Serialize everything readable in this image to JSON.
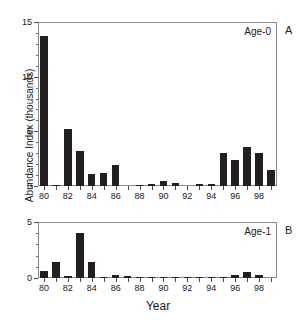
{
  "figure": {
    "xlabel": "Year",
    "ylabel": "Abundance Index (thousands)",
    "bar_color": "#231f20",
    "axis_color": "#8a8a8a"
  },
  "panels": {
    "a": {
      "letter": "A",
      "annotation": "Age-0"
    },
    "b": {
      "letter": "B",
      "annotation": "Age-1"
    }
  },
  "chart_data": [
    {
      "type": "bar",
      "title": "Age-0",
      "panel_letter": "A",
      "xlabel": "Year",
      "ylabel": "Abundance Index (thousands)",
      "ylim": [
        0,
        15
      ],
      "yticks": [
        0,
        5,
        10,
        15
      ],
      "yticklabels": [
        "0",
        "5",
        "10",
        "15"
      ],
      "grid": false,
      "legend": "none",
      "categories": [
        "80",
        "81",
        "82",
        "83",
        "84",
        "85",
        "86",
        "87",
        "88",
        "89",
        "90",
        "91",
        "92",
        "93",
        "94",
        "95",
        "96",
        "97",
        "98",
        "99"
      ],
      "xticklabels": [
        "80",
        "82",
        "84",
        "86",
        "88",
        "90",
        "92",
        "94",
        "96",
        "98"
      ],
      "values": [
        13.7,
        0.1,
        5.2,
        3.2,
        1.1,
        1.2,
        1.9,
        0.0,
        0.1,
        0.2,
        0.5,
        0.3,
        0.0,
        0.15,
        0.15,
        3.0,
        2.4,
        3.6,
        3.0,
        1.5
      ]
    },
    {
      "type": "bar",
      "title": "Age-1",
      "panel_letter": "B",
      "xlabel": "Year",
      "ylabel": "Abundance Index (thousands)",
      "ylim": [
        0,
        5
      ],
      "yticks": [
        0,
        5
      ],
      "yticklabels": [
        "0",
        "5"
      ],
      "grid": false,
      "legend": "none",
      "categories": [
        "80",
        "81",
        "82",
        "83",
        "84",
        "85",
        "86",
        "87",
        "88",
        "89",
        "90",
        "91",
        "92",
        "93",
        "94",
        "95",
        "96",
        "97",
        "98",
        "99"
      ],
      "xticklabels": [
        "80",
        "82",
        "84",
        "86",
        "88",
        "90",
        "92",
        "94",
        "96",
        "98"
      ],
      "values": [
        0.65,
        1.45,
        0.15,
        4.0,
        1.45,
        0.1,
        0.25,
        0.22,
        0.03,
        0.03,
        0.03,
        0.03,
        0.02,
        0.02,
        0.03,
        0.08,
        0.3,
        0.5,
        0.3,
        0.0
      ]
    }
  ]
}
